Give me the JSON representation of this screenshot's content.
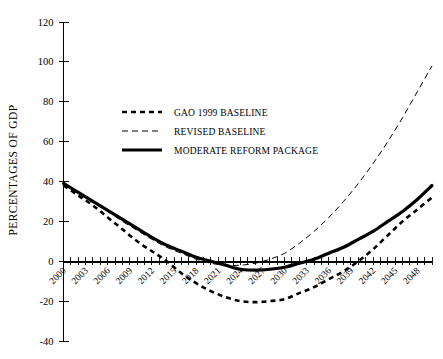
{
  "chart_data": {
    "type": "line",
    "title": "",
    "xlabel": "",
    "ylabel": "PERCENTAGES OF GDP",
    "xlim": [
      2000,
      2050
    ],
    "ylim": [
      -40,
      120
    ],
    "yticks": [
      -40,
      -20,
      0,
      20,
      40,
      60,
      80,
      100,
      120
    ],
    "ytick_labels": [
      "-40",
      "-20",
      "0",
      "20",
      "40",
      "60",
      "80",
      "100",
      "120"
    ],
    "xticks": [
      2000,
      2003,
      2006,
      2009,
      2012,
      2015,
      2018,
      2021,
      2024,
      2027,
      2030,
      2033,
      2036,
      2039,
      2042,
      2045,
      2048
    ],
    "xtick_labels": [
      "2000",
      "2003",
      "2006",
      "2009",
      "2012",
      "2015",
      "2018",
      "2021",
      "2024",
      "2027",
      "2030",
      "2033",
      "2036",
      "2039",
      "2042",
      "2045",
      "2048"
    ],
    "xtick_rotation": 45,
    "x_minor_tick_interval": 1,
    "grid": false,
    "legend_position": "upper-left-inside",
    "axis_color": "#000000",
    "background_color": "#ffffff",
    "x": [
      2000,
      2002,
      2004,
      2006,
      2008,
      2010,
      2012,
      2014,
      2016,
      2018,
      2020,
      2022,
      2024,
      2026,
      2028,
      2030,
      2032,
      2034,
      2036,
      2038,
      2040,
      2042,
      2044,
      2046,
      2048,
      2050
    ],
    "series": [
      {
        "name": "GAO 1999 BASELINE",
        "style": "dashed-thick",
        "color": "#000000",
        "values": [
          38,
          33,
          28,
          22,
          16,
          10,
          5,
          0,
          -6,
          -11,
          -15,
          -18,
          -20,
          -20.5,
          -20,
          -19,
          -16,
          -13,
          -9,
          -5,
          0,
          6,
          13,
          20,
          26,
          32
        ]
      },
      {
        "name": "REVISED BASELINE",
        "style": "dashed-thin",
        "color": "#000000",
        "values": [
          38.5,
          34,
          29.5,
          25,
          20,
          15.5,
          11,
          7,
          4,
          1,
          -1,
          -2,
          -2,
          -1,
          1,
          4,
          9,
          15,
          22,
          30,
          39,
          49,
          60,
          72,
          85,
          98
        ]
      },
      {
        "name": "MODERATE REFORM PACKAGE",
        "style": "solid-thick",
        "color": "#000000",
        "values": [
          39,
          34.5,
          30,
          25.5,
          21,
          16.5,
          12,
          8,
          5,
          2,
          0,
          -2,
          -4,
          -4.5,
          -4,
          -3,
          -1,
          1,
          4,
          7,
          11,
          15,
          20,
          25,
          31,
          38
        ]
      }
    ]
  },
  "legend": {
    "items": [
      {
        "label": "GAO 1999 BASELINE",
        "marker": "dashed-thick"
      },
      {
        "label": "REVISED BASELINE",
        "marker": "dashed-thin"
      },
      {
        "label": "MODERATE REFORM PACKAGE",
        "marker": "solid-thick"
      }
    ]
  }
}
